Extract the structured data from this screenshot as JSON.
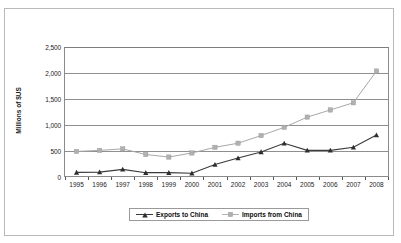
{
  "scan": {
    "bleed_text": "                  "
  },
  "chart_data": {
    "type": "line",
    "title": "",
    "subtitle": "",
    "xlabel": "",
    "ylabel": "Millions of $US",
    "x": [
      1995,
      1996,
      1997,
      1998,
      1999,
      2000,
      2001,
      2002,
      2003,
      2004,
      2005,
      2006,
      2007,
      2008
    ],
    "categories": [
      "1995",
      "1996",
      "1997",
      "1998",
      "1999",
      "2000",
      "2001",
      "2002",
      "2003",
      "2004",
      "2005",
      "2006",
      "2007",
      "2008"
    ],
    "series": [
      {
        "name": "Exports to China",
        "marker": "triangle",
        "color": "#3a3a3a",
        "values": [
          70,
          75,
          130,
          65,
          65,
          55,
          225,
          350,
          470,
          640,
          500,
          500,
          560,
          800
        ]
      },
      {
        "name": "Imports from China",
        "marker": "square",
        "color": "#a8a8a8",
        "values": [
          480,
          500,
          530,
          420,
          370,
          450,
          560,
          640,
          790,
          950,
          1150,
          1290,
          1430,
          2050
        ]
      }
    ],
    "ylim": [
      0,
      2500
    ],
    "yticks": [
      0,
      500,
      1000,
      1500,
      2000,
      2500
    ],
    "ytick_labels": [
      "0",
      "500",
      "1,000",
      "1,500",
      "2,000",
      "2,500"
    ],
    "xlim": [
      1994.5,
      2008.5
    ],
    "grid": "horizontal",
    "legend_position": "bottom-center",
    "legend_entries": [
      "Exports to China",
      "Imports from China"
    ]
  }
}
